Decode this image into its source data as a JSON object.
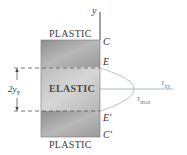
{
  "diagram": {
    "axis_label": "y",
    "zones": {
      "top": "PLASTIC",
      "middle": "ELASTIC",
      "bottom": "PLASTIC"
    },
    "points": {
      "C": "C",
      "E": "E",
      "E_prime": "E'",
      "C_prime": "C'"
    },
    "dimension": {
      "label_main": "2y",
      "label_sub": "Y"
    },
    "stress": {
      "axis_symbol": "τ",
      "axis_sub": "xy",
      "max_symbol": "τ",
      "max_sub": "max"
    },
    "colors": {
      "block_fill": "#a9a9a9",
      "elastic_fill": "#c4c4c4",
      "curve": "#b9c3cc",
      "axis_line": "#9aa7b2",
      "tau_text": "#6a8aa8"
    }
  }
}
